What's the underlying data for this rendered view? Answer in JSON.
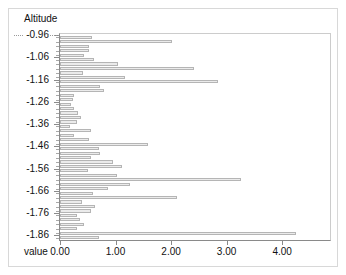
{
  "chart_data": {
    "type": "bar",
    "orientation": "horizontal",
    "title": "",
    "xlabel": "value",
    "ylabel": "Altitude",
    "grid": false,
    "legend": null,
    "xlim": [
      0.0,
      4.88
    ],
    "ylim": [
      -1.885,
      -0.955
    ],
    "x_tick_labels": [
      "0.00",
      "1.00",
      "2.00",
      "3.00",
      "4.00"
    ],
    "x_tick_values": [
      0.0,
      1.0,
      2.0,
      3.0,
      4.0
    ],
    "y_tick_labels": [
      "-0.96",
      "-1.06",
      "-1.16",
      "-1.26",
      "-1.36",
      "-1.46",
      "-1.56",
      "-1.66",
      "-1.76",
      "-1.86"
    ],
    "y_tick_values": [
      -0.96,
      -1.06,
      -1.16,
      -1.26,
      -1.36,
      -1.46,
      -1.56,
      -1.66,
      -1.76,
      -1.86
    ],
    "categories": [
      -0.96,
      -0.98,
      -1.0,
      -1.02,
      -1.04,
      -1.06,
      -1.08,
      -1.1,
      -1.12,
      -1.14,
      -1.16,
      -1.18,
      -1.2,
      -1.22,
      -1.24,
      -1.26,
      -1.28,
      -1.3,
      -1.32,
      -1.34,
      -1.36,
      -1.38,
      -1.4,
      -1.42,
      -1.44,
      -1.46,
      -1.48,
      -1.5,
      -1.52,
      -1.54,
      -1.56,
      -1.58,
      -1.6,
      -1.62,
      -1.64,
      -1.66,
      -1.68,
      -1.7,
      -1.72,
      -1.74,
      -1.76,
      -1.78,
      -1.8,
      -1.82,
      -1.84,
      -1.86
    ],
    "values": [
      0.58,
      2.02,
      0.52,
      0.52,
      0.44,
      0.62,
      1.05,
      2.42,
      0.42,
      1.17,
      2.85,
      0.72,
      0.8,
      0.26,
      0.23,
      0.2,
      0.26,
      0.33,
      0.38,
      0.3,
      0.18,
      0.56,
      0.26,
      0.53,
      1.58,
      0.7,
      0.72,
      0.56,
      0.96,
      1.12,
      0.5,
      1.02,
      3.26,
      1.26,
      0.86,
      0.6,
      2.1,
      0.4,
      0.63,
      0.56,
      0.3,
      0.36,
      0.44,
      0.3,
      4.25,
      0.7
    ]
  }
}
